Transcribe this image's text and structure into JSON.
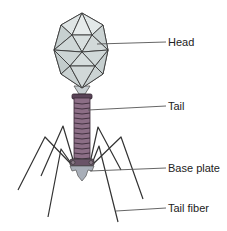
{
  "diagram": {
    "labels": {
      "head": "Head",
      "tail": "Tail",
      "base_plate": "Base plate",
      "tail_fiber": "Tail fiber"
    },
    "colors": {
      "head_fill": "#d4dcdc",
      "head_stroke": "#3a3a3a",
      "tail_fill": "#8c6e86",
      "tail_ring": "#3a2a38",
      "base_plate_fill": "#a8aeb8",
      "fiber_stroke": "#333333",
      "leader_line": "#555555",
      "text": "#222222"
    }
  }
}
